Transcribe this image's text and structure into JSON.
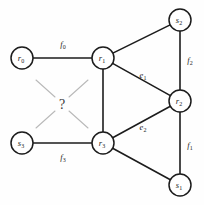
{
  "diagram": {
    "nodes": [
      {
        "id": "r0",
        "base": "r",
        "sub": "0",
        "cx": 22,
        "cy": 58,
        "radius": 11
      },
      {
        "id": "r1",
        "base": "r",
        "sub": "1",
        "cx": 103,
        "cy": 58,
        "radius": 11
      },
      {
        "id": "s3",
        "base": "s",
        "sub": "3",
        "cx": 22,
        "cy": 143,
        "radius": 11
      },
      {
        "id": "r3",
        "base": "r",
        "sub": "3",
        "cx": 103,
        "cy": 143,
        "radius": 11
      },
      {
        "id": "s2",
        "base": "s",
        "sub": "2",
        "cx": 180,
        "cy": 20,
        "radius": 11
      },
      {
        "id": "r2",
        "base": "r",
        "sub": "2",
        "cx": 180,
        "cy": 101,
        "radius": 11
      },
      {
        "id": "s1",
        "base": "s",
        "sub": "1",
        "cx": 180,
        "cy": 185,
        "radius": 11
      }
    ],
    "edges": [
      {
        "id": "edge-r0-r1",
        "from": "r0",
        "to": "r1",
        "label_base": "f",
        "label_sub": "0",
        "label_x": 63,
        "label_y": 44
      },
      {
        "id": "edge-s3-r3",
        "from": "s3",
        "to": "r3",
        "label_base": "f",
        "label_sub": "3",
        "label_x": 63,
        "label_y": 157
      },
      {
        "id": "edge-r1-r3",
        "from": "r1",
        "to": "r3",
        "label_base": "",
        "label_sub": "",
        "label_x": 0,
        "label_y": 0
      },
      {
        "id": "edge-r1-s2",
        "from": "r1",
        "to": "s2",
        "label_base": "",
        "label_sub": "",
        "label_x": 0,
        "label_y": 0
      },
      {
        "id": "edge-r1-r2",
        "from": "r1",
        "to": "r2",
        "label_base": "e",
        "label_sub": "1",
        "label_x": 143,
        "label_y": 75
      },
      {
        "id": "edge-r3-r2",
        "from": "r3",
        "to": "r2",
        "label_base": "e",
        "label_sub": "2",
        "label_x": 143,
        "label_y": 127
      },
      {
        "id": "edge-r3-s1",
        "from": "r3",
        "to": "s1",
        "label_base": "",
        "label_sub": "",
        "label_x": 0,
        "label_y": 0
      },
      {
        "id": "edge-s2-r2",
        "from": "s2",
        "to": "r2",
        "label_base": "f",
        "label_sub": "2",
        "label_x": 190,
        "label_y": 60
      },
      {
        "id": "edge-r2-s1",
        "from": "r2",
        "to": "s1",
        "label_base": "f",
        "label_sub": "1",
        "label_x": 190,
        "label_y": 145
      }
    ],
    "unknown_region": {
      "symbol": "?",
      "x": 62,
      "y": 104,
      "rays": [
        {
          "x1": 36,
          "y1": 80,
          "x2": 55,
          "y2": 97
        },
        {
          "x1": 88,
          "y1": 80,
          "x2": 69,
          "y2": 97
        },
        {
          "x1": 36,
          "y1": 128,
          "x2": 55,
          "y2": 111
        },
        {
          "x1": 88,
          "y1": 128,
          "x2": 69,
          "y2": 111
        }
      ]
    }
  }
}
